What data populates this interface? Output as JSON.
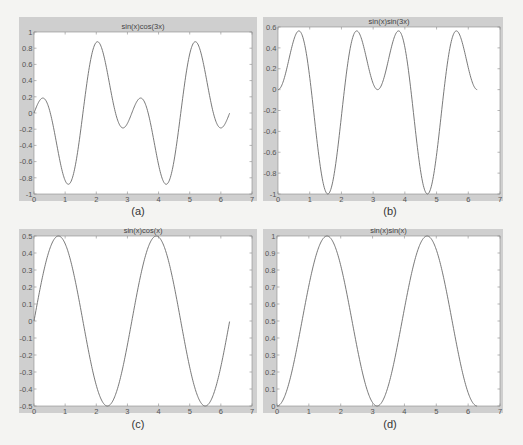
{
  "chart_data": [
    {
      "id": "a",
      "type": "line",
      "title": "sin(x)cos(3x)",
      "caption": "(a)",
      "function": "sin(x)*cos(3*x)",
      "x_range": [
        0,
        6.28
      ],
      "xlim": [
        0,
        7
      ],
      "ylim": [
        -1,
        1
      ],
      "xticks": [
        0,
        1,
        2,
        3,
        4,
        5,
        6,
        7
      ],
      "xtick_labels": [
        "0",
        "1",
        "2",
        "3",
        "4",
        "5",
        "6",
        "7"
      ],
      "yticks": [
        -1,
        -0.8,
        -0.6,
        -0.4,
        -0.2,
        0,
        0.2,
        0.4,
        0.6,
        0.8,
        1
      ],
      "ytick_labels": [
        "-1",
        "-0.8",
        "-0.6",
        "-0.4",
        "-0.2",
        "0",
        "0.2",
        "0.4",
        "0.6",
        "0.8",
        "1"
      ],
      "xlabel": "",
      "ylabel": "",
      "grid": false
    },
    {
      "id": "b",
      "type": "line",
      "title": "sin(x)sin(3x)",
      "caption": "(b)",
      "function": "sin(x)*sin(3*x)",
      "x_range": [
        0,
        6.28
      ],
      "xlim": [
        0,
        7
      ],
      "ylim": [
        -1,
        0.6
      ],
      "xticks": [
        0,
        1,
        2,
        3,
        4,
        5,
        6,
        7
      ],
      "xtick_labels": [
        "0",
        "1",
        "2",
        "3",
        "4",
        "5",
        "6",
        "7"
      ],
      "yticks": [
        -1,
        -0.8,
        -0.6,
        -0.4,
        -0.2,
        0,
        0.2,
        0.4,
        0.6
      ],
      "ytick_labels": [
        "-1",
        "-0.8",
        "-0.6",
        "-0.4",
        "-0.2",
        "0",
        "0.2",
        "0.4",
        "0.6"
      ],
      "xlabel": "",
      "ylabel": "",
      "grid": false
    },
    {
      "id": "c",
      "type": "line",
      "title": "sin(x)cos(x)",
      "caption": "(c)",
      "function": "sin(x)*cos(x)",
      "x_range": [
        0,
        6.28
      ],
      "xlim": [
        0,
        7
      ],
      "ylim": [
        -0.5,
        0.5
      ],
      "xticks": [
        0,
        1,
        2,
        3,
        4,
        5,
        6,
        7
      ],
      "xtick_labels": [
        "0",
        "1",
        "2",
        "3",
        "4",
        "5",
        "6",
        "7"
      ],
      "yticks": [
        -0.5,
        -0.4,
        -0.3,
        -0.2,
        -0.1,
        0,
        0.1,
        0.2,
        0.3,
        0.4,
        0.5
      ],
      "ytick_labels": [
        "-0.5",
        "-0.4",
        "-0.3",
        "-0.2",
        "-0.1",
        "0",
        "0.1",
        "0.2",
        "0.3",
        "0.4",
        "0.5"
      ],
      "xlabel": "",
      "ylabel": "",
      "grid": false
    },
    {
      "id": "d",
      "type": "line",
      "title": "sin(x)sin(x)",
      "caption": "(d)",
      "function": "sin(x)*sin(x)",
      "x_range": [
        0,
        6.28
      ],
      "xlim": [
        0,
        7
      ],
      "ylim": [
        0,
        1
      ],
      "xticks": [
        0,
        1,
        2,
        3,
        4,
        5,
        6,
        7
      ],
      "xtick_labels": [
        "0",
        "1",
        "2",
        "3",
        "4",
        "5",
        "6",
        "7"
      ],
      "yticks": [
        0,
        0.1,
        0.2,
        0.3,
        0.4,
        0.5,
        0.6,
        0.7,
        0.8,
        0.9,
        1
      ],
      "ytick_labels": [
        "0",
        "0.1",
        "0.2",
        "0.3",
        "0.4",
        "0.5",
        "0.6",
        "0.7",
        "0.8",
        "0.9",
        "1"
      ],
      "xlabel": "",
      "ylabel": "",
      "grid": false
    }
  ]
}
